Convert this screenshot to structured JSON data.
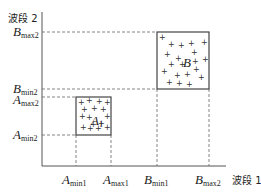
{
  "diagram": {
    "y_axis_label": "波段 2",
    "x_axis_label": "波段 1",
    "y_ticks": [
      {
        "main": "B",
        "sub": "max2",
        "y": 32
      },
      {
        "main": "B",
        "sub": "min2",
        "y": 89
      },
      {
        "main": "A",
        "sub": "max2",
        "y": 97
      },
      {
        "main": "A",
        "sub": "min2",
        "y": 135
      }
    ],
    "x_ticks": [
      {
        "main": "A",
        "sub": "min1",
        "x": 76
      },
      {
        "main": "A",
        "sub": "max1",
        "x": 111
      },
      {
        "main": "B",
        "sub": "min1",
        "x": 157
      },
      {
        "main": "B",
        "sub": "max2",
        "x": 209
      }
    ],
    "boxes": [
      {
        "name": "A",
        "label": "A",
        "label_sub": "1"
      },
      {
        "name": "B",
        "label": "B"
      }
    ],
    "marker": "+"
  }
}
